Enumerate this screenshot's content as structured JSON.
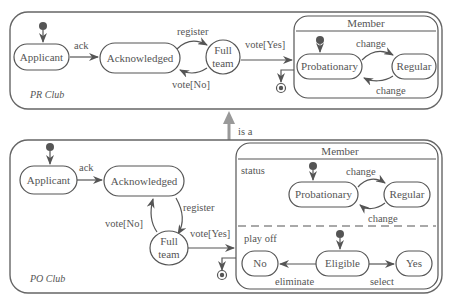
{
  "colors": {
    "line": "#555555",
    "text": "#555555",
    "fill": "#ffffff",
    "inherit_arrow": "#999999"
  },
  "inheritance": {
    "label": "is a"
  },
  "pr_club": {
    "name": "PR Club",
    "states": {
      "applicant": "Applicant",
      "acknowledged": "Acknowledged",
      "full_team_1": "Full",
      "full_team_2": "team"
    },
    "transitions": {
      "ack": "ack",
      "register": "register",
      "vote_no": "vote[No]",
      "vote_yes": "vote[Yes]"
    },
    "member": {
      "title": "Member",
      "states": {
        "probationary": "Probationary",
        "regular": "Regular"
      },
      "transitions": {
        "change_top": "change",
        "change_bottom": "change"
      }
    }
  },
  "po_club": {
    "name": "PO Club",
    "states": {
      "applicant": "Applicant",
      "acknowledged": "Acknowledged",
      "full_team_1": "Full",
      "full_team_2": "team"
    },
    "transitions": {
      "ack": "ack",
      "register": "register",
      "vote_no": "vote[No]",
      "vote_yes": "vote[Yes]"
    },
    "member": {
      "title": "Member",
      "regions": {
        "status": {
          "label": "status",
          "states": {
            "probationary": "Probationary",
            "regular": "Regular"
          },
          "transitions": {
            "change_top": "change",
            "change_bottom": "change"
          }
        },
        "play_off": {
          "label": "play off",
          "states": {
            "no": "No",
            "eligible": "Eligible",
            "yes": "Yes"
          },
          "transitions": {
            "eliminate": "eliminate",
            "select": "select"
          }
        }
      }
    }
  }
}
